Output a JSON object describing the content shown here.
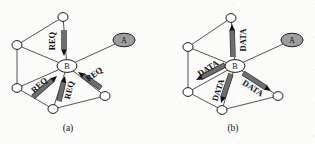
{
  "figure": {
    "background_color": "#fbfbfa",
    "line_color": "#2a2a2a",
    "shaded_node_color": "#9e9e9e",
    "arrow_fill_color": "#6e6e6e",
    "panels": [
      {
        "id": "panel-a",
        "caption": "(a)",
        "caption_pos": [
          68,
          128
        ],
        "hub_label": "B",
        "hub_pos": [
          67,
          66
        ],
        "source_label": "A",
        "source_pos": [
          124,
          40
        ],
        "message_label": "REQ",
        "message_direction": "inbound-to-hub",
        "nodes": [
          {
            "name": "top",
            "label": "",
            "x": 63,
            "y": 17,
            "rx": 5,
            "ry": 4.4,
            "shaded": false
          },
          {
            "name": "upper-left",
            "label": "",
            "x": 17,
            "y": 45,
            "rx": 5,
            "ry": 4.4,
            "shaded": false
          },
          {
            "name": "lower-left",
            "label": "",
            "x": 17,
            "y": 88,
            "rx": 5,
            "ry": 4.4,
            "shaded": false
          },
          {
            "name": "bottom",
            "label": "",
            "x": 53,
            "y": 109,
            "rx": 5,
            "ry": 4.4,
            "shaded": false
          },
          {
            "name": "lower-right",
            "label": "",
            "x": 105,
            "y": 96,
            "rx": 5,
            "ry": 4.4,
            "shaded": false
          },
          {
            "name": "hub",
            "label": "B",
            "x": 67,
            "y": 66,
            "rx": 10,
            "ry": 6.4,
            "shaded": false
          },
          {
            "name": "source",
            "label": "A",
            "x": 124,
            "y": 40,
            "rx": 11,
            "ry": 6.8,
            "shaded": true
          }
        ],
        "edges": [
          [
            63,
            17,
            17,
            45
          ],
          [
            17,
            45,
            17,
            88
          ],
          [
            17,
            88,
            53,
            109
          ],
          [
            53,
            109,
            105,
            96
          ],
          [
            63,
            17,
            67,
            66
          ],
          [
            17,
            45,
            67,
            66
          ],
          [
            17,
            88,
            67,
            66
          ],
          [
            53,
            109,
            67,
            66
          ],
          [
            105,
            96,
            67,
            66
          ],
          [
            124,
            40,
            67,
            66
          ]
        ],
        "arrows": [
          {
            "name": "req-from-top",
            "x1": 64,
            "y1": 30,
            "x2": 64,
            "y2": 56,
            "label_x": 52,
            "label_y": 41,
            "label_rot": -90
          },
          {
            "name": "req-from-lower-left",
            "x1": 33,
            "y1": 97,
            "x2": 57,
            "y2": 76,
            "label_x": 39,
            "label_y": 85,
            "label_rot": -42
          },
          {
            "name": "req-from-bottom",
            "x1": 59,
            "y1": 101,
            "x2": 65,
            "y2": 76,
            "label_x": 69,
            "label_y": 90,
            "label_rot": -76
          },
          {
            "name": "req-from-lower-right",
            "x1": 101,
            "y1": 88,
            "x2": 78,
            "y2": 72,
            "label_x": 94,
            "label_y": 74,
            "label_rot": -36
          }
        ]
      },
      {
        "id": "panel-b",
        "caption": "(b)",
        "caption_pos": [
          233,
          128
        ],
        "hub_label": "B",
        "hub_pos": [
          235,
          66
        ],
        "source_label": "A",
        "source_pos": [
          292,
          40
        ],
        "message_label": "DATA",
        "message_direction": "outbound-from-hub",
        "nodes": [
          {
            "name": "top",
            "label": "",
            "x": 231,
            "y": 18,
            "rx": 5,
            "ry": 4.4,
            "shaded": false
          },
          {
            "name": "upper-left",
            "label": "",
            "x": 188,
            "y": 47,
            "rx": 5,
            "ry": 4.4,
            "shaded": false
          },
          {
            "name": "lower-left",
            "label": "",
            "x": 188,
            "y": 92,
            "rx": 5,
            "ry": 4.4,
            "shaded": false
          },
          {
            "name": "bottom",
            "label": "",
            "x": 222,
            "y": 110,
            "rx": 5,
            "ry": 4.4,
            "shaded": false
          },
          {
            "name": "lower-right",
            "label": "",
            "x": 278,
            "y": 96,
            "rx": 5,
            "ry": 4.4,
            "shaded": false
          },
          {
            "name": "hub",
            "label": "B",
            "x": 235,
            "y": 66,
            "rx": 10,
            "ry": 6.4,
            "shaded": false
          },
          {
            "name": "source",
            "label": "A",
            "x": 292,
            "y": 40,
            "rx": 11,
            "ry": 6.8,
            "shaded": true
          }
        ],
        "edges": [
          [
            231,
            18,
            188,
            47
          ],
          [
            188,
            47,
            188,
            92
          ],
          [
            188,
            92,
            222,
            110
          ],
          [
            222,
            110,
            278,
            96
          ],
          [
            231,
            18,
            235,
            66
          ],
          [
            188,
            47,
            235,
            66
          ],
          [
            188,
            92,
            235,
            66
          ],
          [
            222,
            110,
            235,
            66
          ],
          [
            278,
            96,
            235,
            66
          ],
          [
            292,
            40,
            235,
            66
          ]
        ],
        "arrows": [
          {
            "name": "data-to-top",
            "x1": 233,
            "y1": 57,
            "x2": 232,
            "y2": 24,
            "label_x": 243,
            "label_y": 40,
            "label_rot": -90
          },
          {
            "name": "data-to-upper-left",
            "x1": 225,
            "y1": 65,
            "x2": 196,
            "y2": 80,
            "label_x": 208,
            "label_y": 68,
            "label_rot": -33
          },
          {
            "name": "data-to-bottom",
            "x1": 231,
            "y1": 74,
            "x2": 221,
            "y2": 103,
            "label_x": 218,
            "label_y": 90,
            "label_rot": -72
          },
          {
            "name": "data-to-lower-right",
            "x1": 243,
            "y1": 73,
            "x2": 271,
            "y2": 91,
            "label_x": 253,
            "label_y": 88,
            "label_rot": 33
          }
        ]
      }
    ]
  }
}
